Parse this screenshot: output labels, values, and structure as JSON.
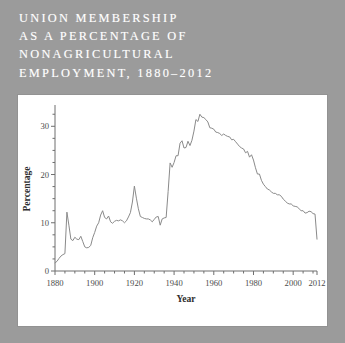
{
  "figure": {
    "background_color": "#9b9b9b",
    "panel_color": "#ffffff",
    "line_color": "#8a8a8a",
    "axis_color": "#6e6e6e",
    "title_color": "#ffffff"
  },
  "title": {
    "lines": [
      "UNION MEMBERSHIP",
      "AS A PERCENTAGE OF",
      "NONAGRICULTURAL",
      "EMPLOYMENT, 1880–2012"
    ],
    "full": "UNION MEMBERSHIP AS A PERCENTAGE OF NONAGRICULTURAL EMPLOYMENT, 1880–2012"
  },
  "chart_data": {
    "type": "line",
    "title": "UNION MEMBERSHIP AS A PERCENTAGE OF NONAGRICULTURAL EMPLOYMENT, 1880–2012",
    "xlabel": "Year",
    "ylabel": "Percentage",
    "xlim": [
      1880,
      2012
    ],
    "ylim": [
      0,
      34
    ],
    "grid": false,
    "legend": false,
    "x_ticks_major": [
      1880,
      1900,
      1920,
      1940,
      1960,
      1980,
      2000,
      2012
    ],
    "x_tick_labels": [
      "1880",
      "1900",
      "1920",
      "1940",
      "1960",
      "1980",
      "2000",
      "2012"
    ],
    "x_tick_minor_step": 5,
    "y_ticks_major": [
      0,
      10,
      20,
      30
    ],
    "y_tick_labels": [
      "0",
      "10",
      "20",
      "30"
    ],
    "y_tick_minor_step": 2.5,
    "series": [
      {
        "name": "Union membership (% of nonagricultural employment)",
        "color": "#8a8a8a",
        "x": [
          1880,
          1881,
          1882,
          1883,
          1884,
          1885,
          1886,
          1887,
          1888,
          1889,
          1890,
          1891,
          1892,
          1893,
          1894,
          1895,
          1896,
          1897,
          1898,
          1899,
          1900,
          1901,
          1902,
          1903,
          1904,
          1905,
          1906,
          1907,
          1908,
          1909,
          1910,
          1911,
          1912,
          1913,
          1914,
          1915,
          1916,
          1917,
          1918,
          1919,
          1920,
          1921,
          1922,
          1923,
          1924,
          1925,
          1926,
          1927,
          1928,
          1929,
          1930,
          1931,
          1932,
          1933,
          1934,
          1935,
          1936,
          1937,
          1938,
          1939,
          1940,
          1941,
          1942,
          1943,
          1944,
          1945,
          1946,
          1947,
          1948,
          1949,
          1950,
          1951,
          1952,
          1953,
          1954,
          1955,
          1956,
          1957,
          1958,
          1959,
          1960,
          1961,
          1962,
          1963,
          1964,
          1965,
          1966,
          1967,
          1968,
          1969,
          1970,
          1971,
          1972,
          1973,
          1974,
          1975,
          1976,
          1977,
          1978,
          1979,
          1980,
          1981,
          1982,
          1983,
          1984,
          1985,
          1986,
          1987,
          1988,
          1989,
          1990,
          1991,
          1992,
          1993,
          1994,
          1995,
          1996,
          1997,
          1998,
          1999,
          2000,
          2001,
          2002,
          2003,
          2004,
          2005,
          2006,
          2007,
          2008,
          2009,
          2010,
          2011,
          2012
        ],
        "y": [
          1.7,
          2.0,
          2.6,
          3.1,
          3.4,
          3.6,
          12.2,
          9.5,
          6.6,
          6.3,
          7.0,
          6.6,
          6.5,
          7.2,
          6.1,
          5.0,
          4.8,
          4.9,
          5.3,
          6.9,
          8.0,
          9.3,
          10.0,
          11.6,
          12.5,
          11.1,
          10.8,
          11.4,
          10.2,
          9.9,
          10.3,
          10.5,
          10.4,
          10.6,
          10.4,
          10.0,
          10.4,
          11.2,
          12.1,
          14.3,
          17.6,
          15.1,
          12.9,
          11.3,
          11.1,
          10.9,
          10.8,
          10.8,
          10.6,
          10.2,
          10.7,
          11.2,
          11.3,
          9.5,
          10.8,
          11.0,
          11.1,
          16.5,
          22.4,
          21.5,
          22.5,
          23.9,
          23.9,
          26.5,
          27.0,
          25.5,
          25.6,
          26.9,
          26.0,
          27.1,
          29.0,
          31.4,
          31.0,
          32.5,
          31.9,
          31.8,
          31.4,
          30.9,
          29.7,
          29.6,
          29.4,
          28.8,
          28.7,
          28.5,
          28.1,
          28.4,
          28.1,
          27.9,
          27.8,
          27.2,
          27.3,
          26.8,
          26.3,
          25.8,
          25.5,
          25.3,
          24.5,
          24.8,
          23.6,
          24.1,
          23.0,
          21.4,
          20.1,
          20.1,
          18.8,
          18.0,
          17.5,
          17.0,
          16.8,
          16.4,
          16.1,
          16.1,
          15.8,
          15.8,
          15.5,
          14.9,
          14.5,
          14.1,
          13.9,
          13.9,
          13.5,
          13.4,
          13.3,
          12.9,
          12.5,
          12.5,
          12.0,
          12.1,
          12.4,
          12.3,
          11.9,
          11.8,
          6.6
        ]
      }
    ]
  },
  "axis": {
    "x_title": "Year",
    "y_title": "Percentage"
  }
}
